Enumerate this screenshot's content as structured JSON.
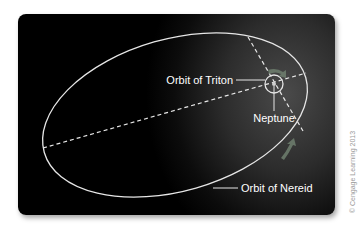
{
  "labels": {
    "triton_orbit": "Orbit of Triton",
    "neptune": "Neptune",
    "nereid_orbit": "Orbit of Nereid"
  },
  "copyright": "© Cengage Learning 2013",
  "colors": {
    "background": "#000000",
    "orbit_line": "#e6e6e6",
    "text": "#ffffff",
    "motion_arrow": "#6f7f6f"
  }
}
